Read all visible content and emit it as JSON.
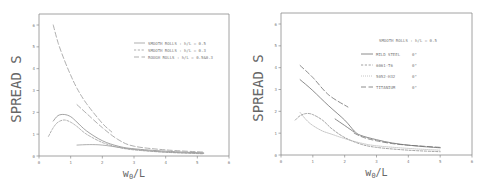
{
  "chart_data": [
    {
      "type": "line",
      "title": "",
      "xlabel": "w0/L",
      "ylabel": "SPREAD  S",
      "xlim": [
        0,
        6
      ],
      "ylim": [
        0,
        6.5
      ],
      "xticks": [
        "0",
        "1",
        "2",
        "3",
        "4",
        "5",
        "6"
      ],
      "yticks": [
        "0",
        "1",
        "2",
        "3",
        "4",
        "5",
        "6"
      ],
      "grid": false,
      "legend_position": "upper right",
      "legend": [
        {
          "label": "SMOOTH ROLLS : h/L = 0.5",
          "style": "solid"
        },
        {
          "label": "SMOOTH ROLLS : h/L = 0.3",
          "style": "short-dash"
        },
        {
          "label": "ROUGH  ROLLS : h/L = 0.5&0.3",
          "style": "long-dash"
        }
      ],
      "series": [
        {
          "name": "SMOOTH ROLLS : h/L = 0.5",
          "style": "solid",
          "color": "#8c8c8c",
          "x": [
            0.45,
            0.6,
            0.8,
            1.0,
            1.2,
            1.5,
            2.0,
            2.5,
            3.0,
            4.0,
            5.2
          ],
          "y": [
            1.6,
            1.85,
            1.9,
            1.8,
            1.55,
            1.15,
            0.7,
            0.45,
            0.33,
            0.22,
            0.14
          ]
        },
        {
          "name": "SMOOTH ROLLS : h/L = 0.5 (lower)",
          "style": "solid",
          "color": "#9a9a9a",
          "x": [
            1.2,
            1.6,
            2.0,
            2.5,
            3.0,
            4.0,
            5.2
          ],
          "y": [
            0.5,
            0.52,
            0.5,
            0.4,
            0.3,
            0.18,
            0.12
          ]
        },
        {
          "name": "SMOOTH ROLLS : h/L = 0.3",
          "style": "short-dash",
          "color": "#9a9a9a",
          "x": [
            0.3,
            0.45,
            0.6,
            0.8,
            1.0,
            1.2,
            1.5,
            2.0,
            2.5,
            3.0,
            4.0,
            5.2
          ],
          "y": [
            0.9,
            1.3,
            1.55,
            1.65,
            1.55,
            1.35,
            1.0,
            0.62,
            0.4,
            0.28,
            0.17,
            0.1
          ]
        },
        {
          "name": "ROUGH ROLLS : h/L = 0.5",
          "style": "long-dash",
          "color": "#9a9a9a",
          "x": [
            0.45,
            0.6,
            0.8,
            1.0,
            1.2,
            1.5,
            2.0,
            2.3
          ],
          "y": [
            6.0,
            5.2,
            4.4,
            3.7,
            3.1,
            2.4,
            1.5,
            1.1
          ]
        },
        {
          "name": "ROUGH ROLLS : h/L = 0.3",
          "style": "long-dash",
          "color": "#9a9a9a",
          "x": [
            1.2,
            1.5,
            2.0,
            2.5,
            3.0,
            4.0,
            5.2
          ],
          "y": [
            2.35,
            1.95,
            1.3,
            0.75,
            0.45,
            0.28,
            0.18
          ]
        }
      ]
    },
    {
      "type": "line",
      "title": "",
      "xlabel": "w0/L",
      "ylabel": "SPREAD  S",
      "xlim": [
        0,
        6
      ],
      "ylim": [
        0,
        6.5
      ],
      "xticks": [
        "0",
        "1",
        "2",
        "3",
        "4",
        "5",
        "6"
      ],
      "yticks": [
        "0",
        "1",
        "2",
        "3",
        "4",
        "5",
        "6"
      ],
      "grid": false,
      "legend_position": "upper right",
      "legend_title": "SMOOTH ROLLS : h/L = 0.5",
      "legend": [
        {
          "label": "MILD STEEL",
          "angle": "0°",
          "style": "solid"
        },
        {
          "label": "6061-T6",
          "angle": "0°",
          "style": "short-dash"
        },
        {
          "label": "5052-H32",
          "angle": "0°",
          "style": "dotted"
        },
        {
          "label": "TITANIUM",
          "angle": "0°",
          "style": "long-dash"
        }
      ],
      "series": [
        {
          "name": "MILD STEEL",
          "style": "solid",
          "color": "#6e6e6e",
          "x": [
            0.6,
            1.0,
            1.5,
            2.0,
            2.3,
            2.5,
            3.0,
            3.5,
            4.0,
            4.5,
            5.0
          ],
          "y": [
            3.45,
            2.95,
            2.25,
            1.6,
            1.1,
            0.9,
            0.7,
            0.55,
            0.45,
            0.38,
            0.33
          ]
        },
        {
          "name": "MILD STEEL (branch)",
          "style": "solid",
          "color": "#6e6e6e",
          "x": [
            1.7,
            2.0,
            2.3
          ],
          "y": [
            1.65,
            1.35,
            1.05
          ]
        },
        {
          "name": "6061-T6",
          "style": "short-dash",
          "color": "#8a8a8a",
          "x": [
            0.45,
            0.6,
            0.8,
            1.0,
            1.3,
            1.6,
            2.0,
            2.5,
            3.0,
            4.0,
            5.0
          ],
          "y": [
            1.6,
            1.8,
            1.9,
            1.85,
            1.6,
            1.2,
            0.8,
            0.5,
            0.35,
            0.22,
            0.15
          ]
        },
        {
          "name": "5052-H32",
          "style": "dotted",
          "color": "#b8b8b8",
          "x": [
            0.6,
            0.8,
            1.0,
            1.3,
            1.6,
            2.0,
            2.5,
            3.0,
            4.0,
            5.0
          ],
          "y": [
            1.95,
            1.6,
            1.35,
            1.1,
            0.95,
            0.75,
            0.55,
            0.42,
            0.3,
            0.22
          ]
        },
        {
          "name": "TITANIUM",
          "style": "long-dash",
          "color": "#6e6e6e",
          "x": [
            0.6,
            1.0,
            1.5,
            2.1
          ],
          "y": [
            4.1,
            3.55,
            2.75,
            2.2
          ]
        },
        {
          "name": "TITANIUM (lower)",
          "style": "long-dash",
          "color": "#6e6e6e",
          "x": [
            2.3,
            2.6,
            3.0,
            3.5,
            4.0,
            4.5,
            5.0
          ],
          "y": [
            1.0,
            0.8,
            0.65,
            0.52,
            0.45,
            0.4,
            0.35
          ]
        }
      ]
    }
  ],
  "left": {
    "ylabel": "SPREAD  S",
    "xlabel_main": "w",
    "xlabel_sub": "0",
    "xlabel_rest": "/L",
    "legend": [
      "SMOOTH ROLLS : h/L = 0.5",
      "SMOOTH ROLLS : h/L = 0.3",
      "ROUGH  ROLLS : h/L = 0.5&0.3"
    ]
  },
  "right": {
    "ylabel": "SPREAD  S",
    "xlabel_main": "w",
    "xlabel_sub": "0",
    "xlabel_rest": "/L",
    "legend_title": "SMOOTH ROLLS : h/L = 0.5",
    "legend": [
      {
        "label": "MILD STEEL",
        "angle": "0°"
      },
      {
        "label": "6061-T6",
        "angle": "0°"
      },
      {
        "label": "5052-H32",
        "angle": "0°"
      },
      {
        "label": "TITANIUM",
        "angle": "0°"
      }
    ]
  }
}
